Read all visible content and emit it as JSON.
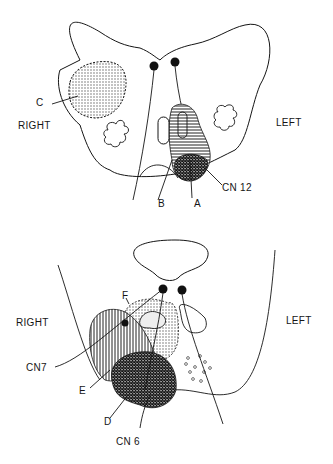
{
  "figure": {
    "top_panel": {
      "name": "medulla-section",
      "labels": {
        "right": "RIGHT",
        "left": "LEFT",
        "c": "C",
        "b": "B",
        "a": "A",
        "cn12": "CN 12"
      }
    },
    "bottom_panel": {
      "name": "pons-section",
      "labels": {
        "right": "RIGHT",
        "left": "LEFT",
        "f": "F",
        "cn7": "CN7",
        "e": "E",
        "d": "D",
        "cn6": "CN 6"
      }
    },
    "colors": {
      "ink": "#151515",
      "background": "#ffffff",
      "stipple": "#9a9a9a"
    }
  }
}
